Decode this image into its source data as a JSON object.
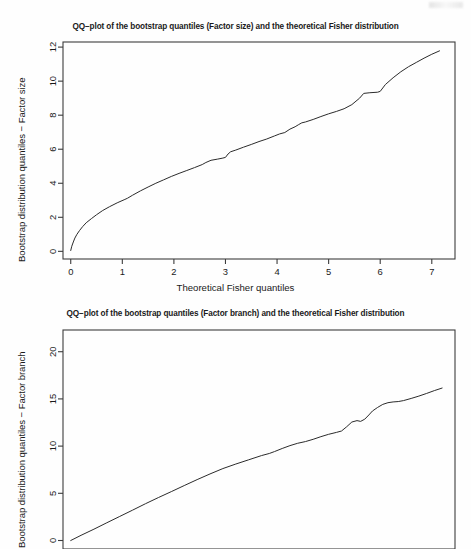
{
  "page": {
    "background": "#fefefe",
    "axis_color": "#3c3c3c",
    "line_color": "#2b2b2b"
  },
  "figures": [
    {
      "name": "factor-size",
      "title": "QQ−plot of the bootstrap quantiles (Factor size) and the theoretical Fisher distribution",
      "xlabel": "Theoretical Fisher quantiles",
      "ylabel": "Bootstrap distribution quantiles − Factor size",
      "xticks": [
        "0",
        "1",
        "2",
        "3",
        "4",
        "5",
        "6",
        "7"
      ],
      "yticks": [
        "0",
        "2",
        "4",
        "6",
        "8",
        "10",
        "12"
      ]
    },
    {
      "name": "factor-branch",
      "title": "QQ−plot of the bootstrap quantiles (Factor branch) and the theoretical Fisher distribution",
      "xlabel": "",
      "ylabel": "Bootstrap distribution quantiles − Factor branch",
      "xticks": [],
      "yticks": [
        "0",
        "5",
        "10",
        "15",
        "20"
      ]
    }
  ],
  "chart_data": [
    {
      "type": "line",
      "name": "factor-size",
      "title": "QQ−plot of the bootstrap quantiles (Factor size) and the theoretical Fisher distribution",
      "xlabel": "Theoretical Fisher quantiles",
      "ylabel": "Bootstrap distribution quantiles − Factor size",
      "xlim": [
        -0.15,
        7.45
      ],
      "ylim": [
        -0.45,
        12.3
      ],
      "xticks": [
        0,
        1,
        2,
        3,
        4,
        5,
        6,
        7
      ],
      "yticks": [
        0,
        2,
        4,
        6,
        8,
        10,
        12
      ],
      "grid": false,
      "legend": "none",
      "x": [
        0.0,
        0.02,
        0.05,
        0.08,
        0.12,
        0.17,
        0.23,
        0.3,
        0.4,
        0.5,
        0.62,
        0.75,
        0.9,
        1.05,
        1.1,
        1.2,
        1.35,
        1.5,
        1.65,
        1.8,
        1.95,
        2.1,
        2.25,
        2.4,
        2.55,
        2.62,
        2.72,
        2.85,
        2.95,
        3.0,
        3.05,
        3.1,
        3.2,
        3.35,
        3.5,
        3.65,
        3.8,
        3.95,
        4.05,
        4.15,
        4.25,
        4.35,
        4.42,
        4.48,
        4.55,
        4.7,
        4.85,
        5.0,
        5.15,
        5.3,
        5.45,
        5.6,
        5.68,
        5.8,
        5.95,
        6.0,
        6.1,
        6.25,
        6.4,
        6.55,
        6.7,
        6.85,
        7.0,
        7.15
      ],
      "y": [
        0.05,
        0.3,
        0.55,
        0.78,
        1.0,
        1.22,
        1.45,
        1.68,
        1.92,
        2.15,
        2.4,
        2.62,
        2.85,
        3.05,
        3.12,
        3.3,
        3.55,
        3.78,
        4.0,
        4.2,
        4.4,
        4.58,
        4.75,
        4.92,
        5.1,
        5.22,
        5.35,
        5.42,
        5.48,
        5.52,
        5.72,
        5.85,
        5.95,
        6.12,
        6.28,
        6.45,
        6.6,
        6.78,
        6.9,
        6.98,
        7.18,
        7.32,
        7.45,
        7.55,
        7.6,
        7.75,
        7.92,
        8.08,
        8.22,
        8.38,
        8.62,
        9.0,
        9.28,
        9.32,
        9.35,
        9.4,
        9.8,
        10.2,
        10.55,
        10.85,
        11.1,
        11.35,
        11.58,
        11.78
      ]
    },
    {
      "type": "line",
      "name": "factor-branch",
      "title": "QQ−plot of the bootstrap quantiles (Factor branch) and the theoretical Fisher distribution",
      "xlabel": "",
      "ylabel": "Bootstrap distribution quantiles − Factor branch",
      "xlim": [
        -0.15,
        7.45
      ],
      "ylim": [
        -0.9,
        22.3
      ],
      "xticks": [],
      "yticks": [
        0,
        5,
        10,
        15,
        20
      ],
      "grid": false,
      "legend": "none",
      "x": [
        0.0,
        0.2,
        0.45,
        0.7,
        0.95,
        1.2,
        1.45,
        1.7,
        1.95,
        2.2,
        2.45,
        2.7,
        2.95,
        3.2,
        3.45,
        3.7,
        3.85,
        3.95,
        4.1,
        4.25,
        4.4,
        4.55,
        4.7,
        4.85,
        5.0,
        5.15,
        5.25,
        5.35,
        5.45,
        5.55,
        5.62,
        5.7,
        5.78,
        5.85,
        5.95,
        6.05,
        6.15,
        6.25,
        6.35,
        6.45,
        6.6,
        6.75,
        6.9,
        7.05,
        7.2
      ],
      "y": [
        0.0,
        0.55,
        1.2,
        1.88,
        2.55,
        3.22,
        3.9,
        4.55,
        5.18,
        5.82,
        6.45,
        7.05,
        7.62,
        8.1,
        8.55,
        9.0,
        9.22,
        9.42,
        9.75,
        10.05,
        10.3,
        10.48,
        10.72,
        11.0,
        11.25,
        11.45,
        11.6,
        12.05,
        12.55,
        12.7,
        12.62,
        12.85,
        13.3,
        13.72,
        14.1,
        14.42,
        14.6,
        14.68,
        14.72,
        14.82,
        15.05,
        15.3,
        15.58,
        15.88,
        16.15
      ]
    }
  ]
}
